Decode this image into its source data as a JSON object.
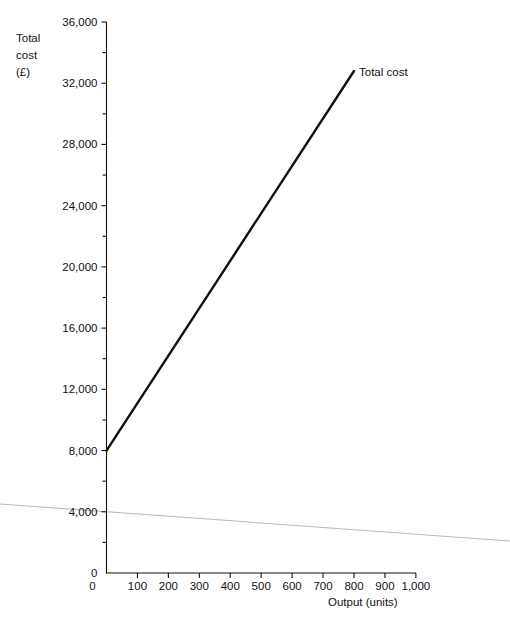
{
  "chart_data": {
    "type": "line",
    "title": "",
    "xlabel": "Output (units)",
    "ylabel": "Total cost (£)",
    "ylabel_lines": [
      "Total",
      "cost",
      "(£)"
    ],
    "xlim": [
      0,
      1000
    ],
    "ylim": [
      0,
      36000
    ],
    "grid": false,
    "legend_position": "inline-end-of-line",
    "x_ticks": [
      0,
      100,
      200,
      300,
      400,
      500,
      600,
      700,
      800,
      900,
      1000
    ],
    "x_tick_labels": [
      "0",
      "100",
      "200",
      "300",
      "400",
      "500",
      "600",
      "700",
      "800",
      "900",
      "1,000"
    ],
    "y_ticks": [
      0,
      4000,
      8000,
      12000,
      16000,
      20000,
      24000,
      28000,
      32000,
      36000
    ],
    "y_tick_labels": [
      "0",
      "4,000",
      "8,000",
      "12,000",
      "16,000",
      "20,000",
      "24,000",
      "28,000",
      "32,000",
      "36,000"
    ],
    "y_minor_tick_step": 2000,
    "series": [
      {
        "name": "Total cost",
        "color": "#111111",
        "annotation": "Total cost",
        "x": [
          0,
          800
        ],
        "values": [
          8000,
          32800
        ]
      }
    ],
    "notes": {
      "intercept": 8000,
      "slope_per_unit": 31
    }
  },
  "artifact": {
    "name": "scan-fold-line",
    "color": "#b9b9b9",
    "x1": 0,
    "y1": 504,
    "x2": 510,
    "y2": 541
  }
}
